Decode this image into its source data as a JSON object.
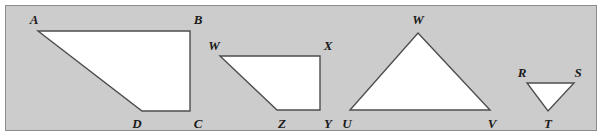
{
  "figure": {
    "background_color": "#cccccc",
    "page_color": "#ffffff",
    "frame_border_color": "#8c8c8c",
    "shape_fill_color": "#ffffff",
    "shape_stroke_color": "#4d4d4d",
    "label_color": "#1a1a1a"
  },
  "shapes": [
    {
      "id": "quadrilateral-abcd",
      "kind": "quadrilateral",
      "name": "ABCD",
      "points": "38,31 190,31 190,111 142,111",
      "vertices": [
        {
          "label": "A",
          "x": 38,
          "y": 31,
          "label_x": 34,
          "label_y": 19
        },
        {
          "label": "B",
          "x": 190,
          "y": 31,
          "label_x": 198,
          "label_y": 19
        },
        {
          "label": "C",
          "x": 190,
          "y": 111,
          "label_x": 198,
          "label_y": 123
        },
        {
          "label": "D",
          "x": 142,
          "y": 111,
          "label_x": 137,
          "label_y": 123
        }
      ]
    },
    {
      "id": "quadrilateral-wxyz",
      "kind": "quadrilateral",
      "name": "WXYZ",
      "points": "220,56 320,56 320,110 277,110",
      "vertices": [
        {
          "label": "W",
          "x": 220,
          "y": 56,
          "label_x": 214,
          "label_y": 45
        },
        {
          "label": "X",
          "x": 320,
          "y": 56,
          "label_x": 328,
          "label_y": 45
        },
        {
          "label": "Y",
          "x": 320,
          "y": 110,
          "label_x": 328,
          "label_y": 123
        },
        {
          "label": "Z",
          "x": 277,
          "y": 110,
          "label_x": 282,
          "label_y": 123
        }
      ]
    },
    {
      "id": "triangle-uvw",
      "kind": "triangle",
      "name": "UVW",
      "points": "418,33 490,110 350,110",
      "vertices": [
        {
          "label": "W",
          "x": 418,
          "y": 33,
          "label_x": 418,
          "label_y": 19
        },
        {
          "label": "V",
          "x": 490,
          "y": 110,
          "label_x": 492,
          "label_y": 123
        },
        {
          "label": "U",
          "x": 350,
          "y": 110,
          "label_x": 347,
          "label_y": 123
        }
      ]
    },
    {
      "id": "triangle-rst",
      "kind": "triangle",
      "name": "RST",
      "points": "527,83 574,83 548,111",
      "vertices": [
        {
          "label": "R",
          "x": 527,
          "y": 83,
          "label_x": 522,
          "label_y": 72
        },
        {
          "label": "S",
          "x": 574,
          "y": 83,
          "label_x": 578,
          "label_y": 72
        },
        {
          "label": "T",
          "x": 548,
          "y": 111,
          "label_x": 548,
          "label_y": 123
        }
      ]
    }
  ]
}
